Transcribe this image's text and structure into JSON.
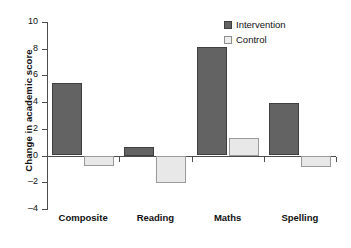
{
  "chart_data": {
    "type": "bar",
    "title": "",
    "xlabel": "",
    "ylabel": "Change in academic score",
    "categories": [
      "Composite",
      "Reading",
      "Maths",
      "Spelling"
    ],
    "series": [
      {
        "name": "Intervention",
        "color": "#636363",
        "values": [
          5.4,
          0.65,
          8.1,
          3.9
        ]
      },
      {
        "name": "Control",
        "color": "#e8e8e8",
        "values": [
          -0.75,
          -2.05,
          1.35,
          -0.8
        ]
      }
    ],
    "ylim": [
      -4,
      10
    ],
    "yticks": [
      10,
      8,
      6,
      4,
      2,
      0,
      -2,
      -4
    ],
    "ytick_labels": [
      "10",
      "8",
      "6",
      "4",
      "2",
      "0",
      "–2",
      "–4"
    ],
    "grid": false,
    "legend_position": "top-right",
    "zero_line": 0
  },
  "legend": {
    "items": [
      {
        "label": "Intervention"
      },
      {
        "label": "Control"
      }
    ]
  }
}
